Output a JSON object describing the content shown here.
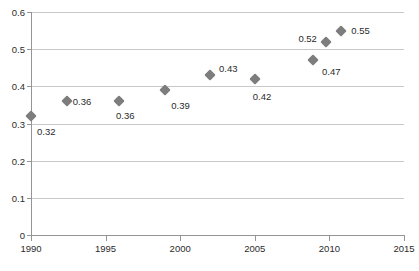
{
  "chart_data": {
    "type": "scatter",
    "title": "",
    "subtitle": "",
    "xlabel": "",
    "ylabel": "",
    "xlim": [
      1990,
      2015
    ],
    "ylim": [
      0,
      0.6
    ],
    "grid": true,
    "legend": false,
    "marker": {
      "shape": "diamond",
      "color": "#7d7d7d",
      "size": 8
    },
    "axes": {
      "x_ticks": [
        1990,
        1995,
        2000,
        2005,
        2010,
        2015
      ],
      "x_tick_labels": [
        "1990",
        "1995",
        "2000",
        "2005",
        "2010",
        "2015"
      ],
      "y_ticks": [
        0,
        0.1,
        0.2,
        0.3,
        0.4,
        0.5,
        0.6
      ],
      "y_tick_labels": [
        "0",
        "0.1",
        "0.2",
        "0.3",
        "0.4",
        "0.5",
        "0.6"
      ]
    },
    "x": [
      1990,
      1992.4,
      1995.9,
      1999,
      2002,
      2005,
      2008.9,
      2009.8,
      2010.8
    ],
    "y": [
      0.32,
      0.36,
      0.36,
      0.39,
      0.43,
      0.42,
      0.47,
      0.52,
      0.55
    ],
    "point_labels": [
      "0.32",
      "0.36",
      "0.36",
      "0.39",
      "0.43",
      "0.42",
      "0.47",
      "0.52",
      "0.55"
    ],
    "points": [
      {
        "x": 1990.0,
        "y": 0.32,
        "label": "0.32",
        "label_dx": 6,
        "label_dy": 16
      },
      {
        "x": 1992.4,
        "y": 0.36,
        "label": "0.36",
        "label_dx": 6,
        "label_dy": 1
      },
      {
        "x": 1995.9,
        "y": 0.36,
        "label": "0.36",
        "label_dx": -3,
        "label_dy": 15
      },
      {
        "x": 1999.0,
        "y": 0.39,
        "label": "0.39",
        "label_dx": 6,
        "label_dy": 16
      },
      {
        "x": 2002.0,
        "y": 0.43,
        "label": "0.43",
        "label_dx": 9,
        "label_dy": -6
      },
      {
        "x": 2005.0,
        "y": 0.42,
        "label": "0.42",
        "label_dx": -2,
        "label_dy": 18
      },
      {
        "x": 2008.9,
        "y": 0.47,
        "label": "0.47",
        "label_dx": 9,
        "label_dy": 12
      },
      {
        "x": 2009.8,
        "y": 0.52,
        "label": "0.52",
        "label_dx": -28,
        "label_dy": -3
      },
      {
        "x": 2010.8,
        "y": 0.55,
        "label": "0.55",
        "label_dx": 10,
        "label_dy": 0
      }
    ]
  },
  "caption": {
    "text": ""
  }
}
